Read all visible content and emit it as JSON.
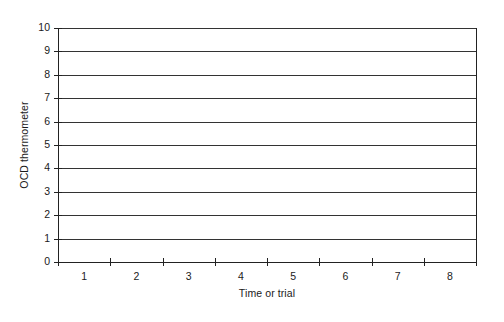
{
  "chart_data": {
    "type": "line",
    "title": "",
    "subtitle": "",
    "xlabel": "Time or trial",
    "ylabel": "OCD thermometer",
    "categories": [
      "1",
      "2",
      "3",
      "4",
      "5",
      "6",
      "7",
      "8"
    ],
    "x": [
      1,
      2,
      3,
      4,
      5,
      6,
      7,
      8
    ],
    "series": [],
    "y_ticks": [
      0,
      1,
      2,
      3,
      4,
      5,
      6,
      7,
      8,
      9,
      10
    ],
    "x_tick_labels": [
      "1",
      "2",
      "3",
      "4",
      "5",
      "6",
      "7",
      "8"
    ],
    "ylim": [
      0,
      10
    ],
    "xlim": [
      0,
      8
    ],
    "grid": "horizontal",
    "gridlines_at": [
      0,
      1,
      2,
      3,
      4,
      5,
      6,
      7,
      8,
      9,
      10
    ],
    "legend": null,
    "legend_position": "none",
    "annotations": [],
    "note": "blank self-monitoring chart; no data plotted",
    "colors": {
      "background": "#ffffff",
      "axis": "#222222",
      "gridline": "#333333",
      "text": "#1a1a1a"
    }
  }
}
